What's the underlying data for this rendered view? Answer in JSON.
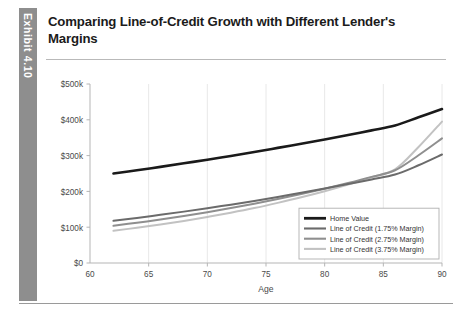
{
  "exhibit": {
    "label": "Exhibit 4.10"
  },
  "header": {
    "title": "Comparing Line-of-Credit Growth with Different Lender's Margins"
  },
  "colors": {
    "home_value": "#1a1a1a",
    "margin_175": "#6b6b6b",
    "margin_275": "#8f8f8f",
    "margin_375": "#c2c2c2",
    "exhibit_tab": "#8e8e8e",
    "axis": "#b5b5b5",
    "grid": "#e8e8e8",
    "text": "#4a4a4a"
  },
  "chart_data": {
    "type": "line",
    "title": "Comparing Line-of-Credit Growth with Different Lender's Margins",
    "xlabel": "Age",
    "ylabel": "",
    "xlim": [
      60,
      90
    ],
    "ylim": [
      0,
      500000
    ],
    "xticks": [
      60,
      65,
      70,
      75,
      80,
      85,
      90
    ],
    "xticklabels": [
      "60",
      "65",
      "70",
      "75",
      "80",
      "85",
      "90"
    ],
    "yticks": [
      0,
      100000,
      200000,
      300000,
      400000,
      500000
    ],
    "yticklabels": [
      "$0",
      "$100k",
      "$200k",
      "$300k",
      "$400k",
      "$500k"
    ],
    "grid": "vertical-faint",
    "legend_position": "lower-right",
    "x": [
      62,
      64,
      66,
      68,
      70,
      72,
      74,
      76,
      78,
      80,
      82,
      84,
      86,
      88,
      90
    ],
    "series": [
      {
        "name": "Home Value",
        "color": "#1a1a1a",
        "width": 2.6,
        "values": [
          250000,
          259000,
          268500,
          278500,
          288500,
          299000,
          310000,
          321500,
          333000,
          345000,
          357500,
          370500,
          384000,
          407000,
          430000
        ]
      },
      {
        "name": "Line of Credit (1.75% Margin)",
        "color": "#6b6b6b",
        "width": 2.0,
        "values": [
          118000,
          126000,
          134500,
          143500,
          153000,
          163000,
          173500,
          184500,
          196000,
          208000,
          220500,
          233500,
          247000,
          273000,
          303000
        ]
      },
      {
        "name": "Line of Credit (2.75% Margin)",
        "color": "#8f8f8f",
        "width": 2.0,
        "values": [
          104000,
          112500,
          121500,
          131500,
          142000,
          153500,
          165500,
          178500,
          192500,
          207500,
          223500,
          240500,
          259000,
          301000,
          348000
        ]
      },
      {
        "name": "Line of Credit (3.75% Margin)",
        "color": "#c2c2c2",
        "width": 2.0,
        "values": [
          90000,
          98500,
          107500,
          117500,
          128500,
          140500,
          153500,
          168000,
          183500,
          200500,
          219000,
          239500,
          261500,
          324000,
          395000
        ]
      }
    ],
    "legend": [
      {
        "label": "Home Value",
        "color": "#1a1a1a",
        "width": 2.8
      },
      {
        "label": "Line of Credit (1.75% Margin)",
        "color": "#6b6b6b",
        "width": 2.1
      },
      {
        "label": "Line of Credit (2.75% Margin)",
        "color": "#8f8f8f",
        "width": 2.1
      },
      {
        "label": "Line of Credit (3.75% Margin)",
        "color": "#c2c2c2",
        "width": 2.1
      }
    ]
  }
}
